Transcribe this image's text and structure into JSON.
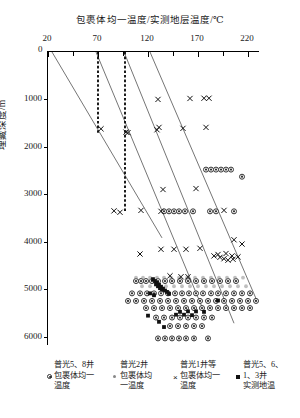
{
  "chart_data": {
    "type": "scatter",
    "title": "",
    "xlabel": "包裹体均一温度/实测地层温度/℃",
    "ylabel": "埋藏深度/m",
    "xlim": [
      20,
      232
    ],
    "ylim": [
      0,
      6200
    ],
    "y_inverted": true,
    "grid": false,
    "legend_position": "bottom",
    "xticks": [
      20,
      70,
      120,
      170,
      220
    ],
    "xticks_minor": [
      45,
      95,
      145,
      195
    ],
    "yticks": [
      0,
      1000,
      2000,
      3000,
      4000,
      5000,
      6000
    ],
    "ytick_labels": [
      "0",
      "1000",
      "2000",
      "3000",
      "4000",
      "5000",
      "6000"
    ],
    "xtick_labels": [
      "20",
      "70",
      "120",
      "170",
      "220"
    ],
    "series": [
      {
        "name": "普光5、8井包裹体均一温度",
        "marker": "ring",
        "color": "#333333",
        "points": [
          [
            178,
            2480
          ],
          [
            183,
            2480
          ],
          [
            188,
            2480
          ],
          [
            193,
            2480
          ],
          [
            198,
            2480
          ],
          [
            203,
            2480
          ],
          [
            136,
            3360
          ],
          [
            141,
            3360
          ],
          [
            146,
            3360
          ],
          [
            151,
            3360
          ],
          [
            157,
            3360
          ],
          [
            165,
            3360
          ],
          [
            182,
            3360
          ],
          [
            188,
            3360
          ],
          [
            206,
            3360
          ],
          [
            214,
            2630
          ],
          [
            108,
            4830
          ],
          [
            113,
            4830
          ],
          [
            118,
            4830
          ],
          [
            124,
            4830
          ],
          [
            130,
            4830
          ],
          [
            137,
            4830
          ],
          [
            144,
            4830
          ],
          [
            152,
            4830
          ],
          [
            160,
            4830
          ],
          [
            168,
            4830
          ],
          [
            176,
            4830
          ],
          [
            184,
            4830
          ],
          [
            192,
            4830
          ],
          [
            200,
            4830
          ],
          [
            208,
            4830
          ],
          [
            104,
            5090
          ],
          [
            112,
            5090
          ],
          [
            119,
            5090
          ],
          [
            126,
            5090
          ],
          [
            133,
            5090
          ],
          [
            140,
            5090
          ],
          [
            147,
            5090
          ],
          [
            154,
            5090
          ],
          [
            161,
            5090
          ],
          [
            168,
            5090
          ],
          [
            175,
            5090
          ],
          [
            183,
            5090
          ],
          [
            190,
            5090
          ],
          [
            198,
            5090
          ],
          [
            206,
            5090
          ],
          [
            214,
            5090
          ],
          [
            222,
            5090
          ],
          [
            100,
            5250
          ],
          [
            108,
            5250
          ],
          [
            116,
            5250
          ],
          [
            124,
            5250
          ],
          [
            132,
            5250
          ],
          [
            140,
            5250
          ],
          [
            148,
            5250
          ],
          [
            156,
            5250
          ],
          [
            164,
            5250
          ],
          [
            172,
            5250
          ],
          [
            180,
            5250
          ],
          [
            188,
            5250
          ],
          [
            196,
            5250
          ],
          [
            204,
            5250
          ],
          [
            212,
            5250
          ],
          [
            220,
            5250
          ],
          [
            228,
            5250
          ],
          [
            118,
            5400
          ],
          [
            126,
            5400
          ],
          [
            134,
            5400
          ],
          [
            142,
            5400
          ],
          [
            150,
            5400
          ],
          [
            158,
            5400
          ],
          [
            166,
            5400
          ],
          [
            174,
            5400
          ],
          [
            182,
            5400
          ],
          [
            190,
            5400
          ],
          [
            198,
            5400
          ],
          [
            206,
            5400
          ],
          [
            214,
            5400
          ],
          [
            222,
            5400
          ],
          [
            128,
            5600
          ],
          [
            136,
            5600
          ],
          [
            144,
            5600
          ],
          [
            152,
            5600
          ],
          [
            160,
            5600
          ],
          [
            168,
            5600
          ],
          [
            176,
            5600
          ],
          [
            184,
            5600
          ],
          [
            142,
            5780
          ],
          [
            150,
            5780
          ],
          [
            158,
            5780
          ],
          [
            166,
            5780
          ],
          [
            174,
            5780
          ],
          [
            130,
            6040
          ],
          [
            137,
            6040
          ],
          [
            144,
            6040
          ],
          [
            151,
            6040
          ],
          [
            158,
            6040
          ],
          [
            166,
            6040
          ],
          [
            180,
            6040
          ]
        ]
      },
      {
        "name": "普光2井包裹体均一温度",
        "marker": "dot",
        "color": "#8a8a8a",
        "points": [
          [
            108,
            4760
          ],
          [
            115,
            4760
          ],
          [
            122,
            4760
          ],
          [
            129,
            4760
          ],
          [
            136,
            4760
          ],
          [
            143,
            4760
          ],
          [
            151,
            4760
          ],
          [
            159,
            4760
          ],
          [
            167,
            4760
          ],
          [
            175,
            4760
          ],
          [
            183,
            4760
          ],
          [
            191,
            4760
          ],
          [
            199,
            4760
          ],
          [
            207,
            4760
          ],
          [
            215,
            4760
          ],
          [
            114,
            4940
          ],
          [
            122,
            4940
          ],
          [
            130,
            4940
          ],
          [
            138,
            4940
          ],
          [
            146,
            4940
          ],
          [
            154,
            4940
          ],
          [
            162,
            4940
          ],
          [
            170,
            4940
          ],
          [
            178,
            4940
          ],
          [
            186,
            4940
          ],
          [
            194,
            4940
          ],
          [
            202,
            4940
          ],
          [
            210,
            4940
          ],
          [
            218,
            4940
          ]
        ]
      },
      {
        "name": "普光1井等包裹体均一温度",
        "marker": "x",
        "color": "#111111",
        "points": [
          [
            98,
            1690
          ],
          [
            73,
            1620
          ],
          [
            131,
            1590
          ],
          [
            155,
            1610
          ],
          [
            178,
            1590
          ],
          [
            130,
            1000
          ],
          [
            162,
            980
          ],
          [
            176,
            975
          ],
          [
            181,
            975
          ],
          [
            100,
            1700
          ],
          [
            129,
            1640
          ],
          [
            135,
            2900
          ],
          [
            168,
            2880
          ],
          [
            113,
            3340
          ],
          [
            133,
            3360
          ],
          [
            196,
            3340
          ],
          [
            92,
            3380
          ],
          [
            86,
            3350
          ],
          [
            112,
            4260
          ],
          [
            133,
            4160
          ],
          [
            146,
            4160
          ],
          [
            158,
            4160
          ],
          [
            172,
            4140
          ],
          [
            186,
            4300
          ],
          [
            192,
            4330
          ],
          [
            196,
            4360
          ],
          [
            200,
            4390
          ],
          [
            205,
            4370
          ],
          [
            190,
            4270
          ],
          [
            198,
            4250
          ],
          [
            204,
            4300
          ],
          [
            210,
            4320
          ],
          [
            153,
            4740
          ],
          [
            160,
            4740
          ],
          [
            142,
            4720
          ],
          [
            206,
            3960
          ],
          [
            214,
            4050
          ]
        ]
      },
      {
        "name": "普光5、6、1、3井实测地温",
        "marker": "square",
        "color": "#111111",
        "points": [
          [
            125,
            4790
          ],
          [
            127,
            4830
          ],
          [
            129,
            4870
          ],
          [
            131,
            4910
          ],
          [
            133,
            4950
          ],
          [
            135,
            4990
          ],
          [
            137,
            5030
          ],
          [
            139,
            5060
          ],
          [
            141,
            5100
          ],
          [
            128,
            4900
          ],
          [
            130,
            4940
          ],
          [
            132,
            4980
          ],
          [
            134,
            5010
          ],
          [
            122,
            5090
          ],
          [
            126,
            5130
          ],
          [
            120,
            5560
          ],
          [
            131,
            5690
          ],
          [
            136,
            5800
          ],
          [
            152,
            5480
          ],
          [
            160,
            5470
          ],
          [
            168,
            5470
          ],
          [
            176,
            5480
          ],
          [
            148,
            5540
          ],
          [
            156,
            5540
          ],
          [
            164,
            5550
          ],
          [
            190,
            5240
          ]
        ]
      }
    ],
    "dashed_lines": [
      {
        "x": 70,
        "y_from": 0,
        "y_to": 1720,
        "style": "dashed-thick"
      },
      {
        "x": 97,
        "y_from": 0,
        "y_to": 3390,
        "style": "dashed-thick"
      }
    ],
    "trend_lines": [
      {
        "from": [
          24,
          0
        ],
        "to": [
          134,
          3920
        ],
        "label": ""
      },
      {
        "from": [
          68,
          0
        ],
        "to": [
          176,
          5480
        ],
        "label": ""
      },
      {
        "from": [
          96,
          0
        ],
        "to": [
          206,
          5720
        ],
        "label": ""
      },
      {
        "from": [
          122,
          0
        ],
        "to": [
          228,
          5200
        ],
        "label": ""
      }
    ]
  },
  "legend": {
    "entries": [
      {
        "head": "普光5、8井",
        "line1": "包裹体均一",
        "line2": "温度",
        "marker": "ring"
      },
      {
        "head": "普光2井",
        "line1": "包裹体均",
        "line2": "一温度",
        "marker": "dot"
      },
      {
        "head": "普光1井等",
        "line1": "包裹体均一",
        "line2": "温度",
        "marker": "x"
      },
      {
        "head": "普光5、6、",
        "line1": "1、3井",
        "line2": "实测地温",
        "marker": "square"
      }
    ]
  }
}
